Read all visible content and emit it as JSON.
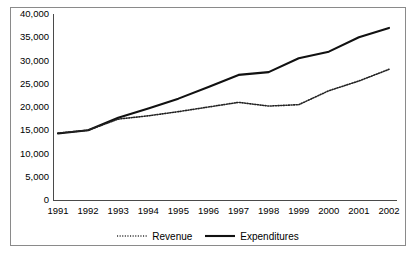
{
  "chart_data": {
    "type": "line",
    "title": "",
    "subtitle": "",
    "xlabel": "",
    "ylabel": "",
    "categories": [
      "1991",
      "1992",
      "1993",
      "1994",
      "1995",
      "1996",
      "1997",
      "1998",
      "1999",
      "2000",
      "2001",
      "2002"
    ],
    "series": [
      {
        "name": "Revenue",
        "style": "dotted",
        "color": "#222222",
        "values": [
          14400,
          15000,
          17400,
          18100,
          19000,
          20000,
          21000,
          20200,
          20500,
          23500,
          25600,
          28100
        ]
      },
      {
        "name": "Expenditures",
        "style": "solid",
        "color": "#111111",
        "values": [
          14300,
          15000,
          17700,
          19700,
          21800,
          24300,
          26900,
          27500,
          30500,
          31900,
          35000,
          37000
        ]
      }
    ],
    "ylim": [
      0,
      40000
    ],
    "ytick_values": [
      0,
      5000,
      10000,
      15000,
      20000,
      25000,
      30000,
      35000,
      40000
    ],
    "ytick_labels": [
      "0",
      "5,000",
      "10,000",
      "15,000",
      "20,000",
      "25,000",
      "30,000",
      "35,000",
      "40,000"
    ],
    "xtick_labels": [
      "1991",
      "1992",
      "1993",
      "1994",
      "1995",
      "1996",
      "1997",
      "1998",
      "1999",
      "2000",
      "2001",
      "2002"
    ],
    "grid": false,
    "legend_position": "bottom",
    "legend": [
      {
        "label": "Revenue",
        "style": "dotted"
      },
      {
        "label": "Expenditures",
        "style": "solid"
      }
    ]
  },
  "axes": {
    "axis_color": "#4a4a4a",
    "border_color": "#8a8a8a"
  }
}
